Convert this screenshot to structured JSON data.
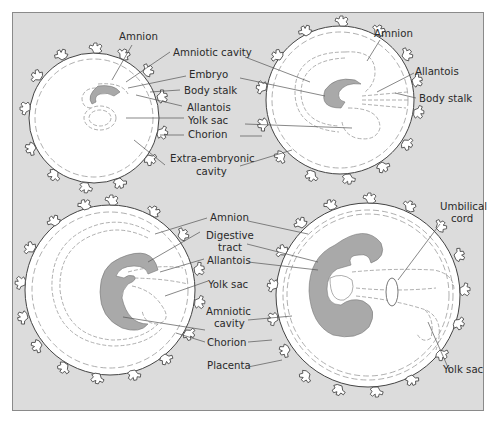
{
  "colors": {
    "background": "#dcdcdc",
    "frame_border": "#8a8a8a",
    "sac_fill": "#ffffff",
    "embryo_fill": "#a9a9a9",
    "line": "#555555",
    "dashed_membrane": "#9a9a9a",
    "text": "#2a2a2a"
  },
  "panels": [
    {
      "id": "stage-1",
      "labels": {
        "amnion": "Amnion",
        "amniotic_cavity": "Amniotic cavity",
        "embryo": "Embryo",
        "body_stalk": "Body stalk",
        "allantois": "Allantois",
        "yolk_sac": "Yolk sac",
        "chorion": "Chorion",
        "extra_embryonic_1": "Extra-embryonic",
        "extra_embryonic_2": "cavity"
      }
    },
    {
      "id": "stage-2",
      "labels": {
        "amnion": "Amnion",
        "allantois": "Allantois",
        "body_stalk": "Body stalk"
      }
    },
    {
      "id": "stage-3",
      "labels": {
        "amnion": "Amnion",
        "digestive_tract_1": "Digestive",
        "digestive_tract_2": "tract",
        "allantois": "Allantois",
        "yolk_sac": "Yolk sac",
        "amniotic_cavity_1": "Amniotic",
        "amniotic_cavity_2": "cavity",
        "chorion": "Chorion",
        "placenta": "Placenta"
      }
    },
    {
      "id": "stage-4",
      "labels": {
        "umbilical_cord_1": "Umbilical",
        "umbilical_cord_2": "cord",
        "yolk_sac": "Yolk sac"
      }
    }
  ]
}
